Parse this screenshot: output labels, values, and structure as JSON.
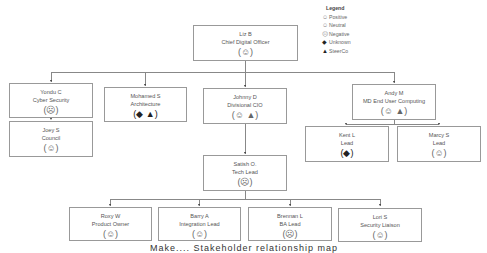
{
  "legend": {
    "title": "Legend",
    "items": [
      {
        "symbol": "☺",
        "label": "Positive"
      },
      {
        "symbol": "☺",
        "label": "Neutral"
      },
      {
        "symbol": "☹",
        "label": "Negative"
      },
      {
        "symbol": "◆",
        "label": "Unknown"
      },
      {
        "symbol": "▲",
        "label": "SteerCo"
      }
    ]
  },
  "nodes": {
    "liz": {
      "name": "Liz B",
      "role": "Chief Digital Officer",
      "icons": "(☺)"
    },
    "yondu": {
      "name": "Yondu C",
      "role": "Cyber Security",
      "icons": "(☹)"
    },
    "joey": {
      "name": "Joey S",
      "role": "Council",
      "icons": "(☺)"
    },
    "mohamed": {
      "name": "Mohamed S",
      "role": "Architecture",
      "icons": "(◆ ▲)"
    },
    "johnny": {
      "name": "Johnny D",
      "role": "Divisional CIO",
      "icons": "(☺ ▲)"
    },
    "andy": {
      "name": "Andy M",
      "role": "MD End User Computing",
      "icons": "(☺ ▲)"
    },
    "kent": {
      "name": "Kent L",
      "role": "Lead",
      "icons": "(◆)"
    },
    "marcy": {
      "name": "Marcy S",
      "role": "Lead",
      "icons": "(☺)"
    },
    "satish": {
      "name": "Satish O.",
      "role": "Tech Lead",
      "icons": "(☹)"
    },
    "roxy": {
      "name": "Roxy W",
      "role": "Product Owner",
      "icons": "(☺)"
    },
    "barry": {
      "name": "Barry A",
      "role": "Integration Lead",
      "icons": "(☺)"
    },
    "brennan": {
      "name": "Brennan L",
      "role": "BA Lead",
      "icons": "(☹)"
    },
    "lori": {
      "name": "Lori S",
      "role": "Security Liaison",
      "icons": "(☺)"
    }
  },
  "caption": "Make.... Stakeholder relationship map"
}
